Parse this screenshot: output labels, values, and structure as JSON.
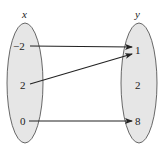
{
  "diagram": {
    "type": "mapping",
    "domain_label": "x",
    "range_label": "y",
    "domain_values": [
      "−2",
      "2",
      "0"
    ],
    "range_values": [
      "1",
      "2",
      "8"
    ],
    "mappings": [
      {
        "from": "−2",
        "to": "1"
      },
      {
        "from": "2",
        "to": "1"
      },
      {
        "from": "0",
        "to": "8"
      }
    ],
    "colors": {
      "ellipse_fill": "#e6e6e6",
      "ellipse_stroke": "#444444",
      "arrow": "#222222"
    }
  }
}
